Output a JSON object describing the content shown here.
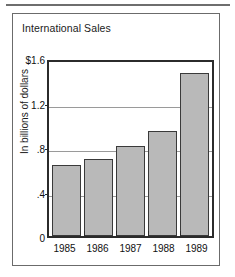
{
  "panel": {
    "title": "International Sales"
  },
  "chart_data": {
    "type": "bar",
    "title": "International Sales",
    "xlabel": "",
    "ylabel": "In billions of dollars",
    "categories": [
      "1985",
      "1986",
      "1987",
      "1988",
      "1989"
    ],
    "values": [
      0.65,
      0.71,
      0.83,
      0.97,
      1.5
    ],
    "ylim": [
      0,
      1.6
    ],
    "ytick_values": [
      1.6,
      1.2,
      0.8,
      0.4,
      0
    ],
    "ytick_labels": [
      "$1.6",
      "1.2",
      ".8",
      ".4",
      "0"
    ],
    "gridlines": [
      1.2,
      0.8,
      0.4
    ],
    "grid": true,
    "legend": "none",
    "bar_color": "#b9b9b9",
    "bar_border_color": "#3a3a3a",
    "axis_color": "#2b2b2b",
    "gridline_color": "#9a9a9a",
    "panel_border_color": "#6b6b6b",
    "background_color": "#ffffff"
  }
}
